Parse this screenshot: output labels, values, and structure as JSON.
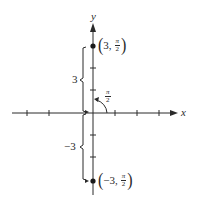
{
  "diagram": {
    "axes": {
      "x_label": "x",
      "y_label": "y",
      "origin_px": [
        93,
        113
      ],
      "x_ticks_px": [
        27,
        49,
        115,
        137,
        159
      ],
      "y_ticks_px": [
        68,
        90,
        135,
        157
      ]
    },
    "points": [
      {
        "name": "point-3-pi-over-2",
        "r": "3",
        "theta_num": "π",
        "theta_den": "2",
        "open": "(",
        "sep": ",",
        "close": ")",
        "px": [
          93,
          46
        ]
      },
      {
        "name": "point-neg3-pi-over-2",
        "r": "−3",
        "theta_num": "π",
        "theta_den": "2",
        "open": "(",
        "sep": ",",
        "close": ")",
        "px": [
          93,
          181
        ]
      }
    ],
    "angle": {
      "num": "π",
      "den": "2"
    },
    "brackets": [
      {
        "label": "3"
      },
      {
        "label": "−3"
      }
    ]
  }
}
